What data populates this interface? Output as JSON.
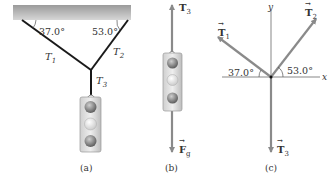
{
  "panel_a": {
    "angle_left": "37.0°",
    "angle_right": "53.0°",
    "t1": "T",
    "t1_sub": "1",
    "t2": "T",
    "t2_sub": "2",
    "t3": "T",
    "t3_sub": "3",
    "caption": "(a)"
  },
  "panel_b": {
    "t3": "T",
    "t3_sub": "3",
    "fg": "F",
    "fg_sub": "g",
    "caption": "(b)"
  },
  "panel_c": {
    "y_axis": "y",
    "x_axis": "x",
    "t1": "T",
    "t1_sub": "1",
    "t2": "T",
    "t2_sub": "2",
    "t3": "T",
    "t3_sub": "3",
    "angle_left": "37.0°",
    "angle_right": "53.0°",
    "caption": "(c)"
  },
  "colors": {
    "ceiling": "#b5b5b5",
    "cable": "#1a1a1a",
    "vector": "#8a8a8a",
    "axis": "#555555"
  }
}
